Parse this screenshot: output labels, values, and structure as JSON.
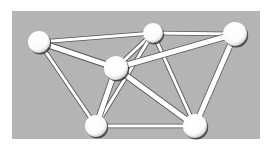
{
  "diagram": {
    "type": "network-graph",
    "colors": {
      "background": "#ffffff",
      "panel": "#b4b4b4",
      "node_fill": "#ffffff",
      "node_shadow": "#2a2a2a",
      "edge_fill": "#ffffff",
      "edge_outline": "#555555"
    },
    "nodes": [
      {
        "id": "A",
        "name": "node-top-left"
      },
      {
        "id": "B",
        "name": "node-top-middle"
      },
      {
        "id": "C",
        "name": "node-center"
      },
      {
        "id": "D",
        "name": "node-bottom-left"
      },
      {
        "id": "E",
        "name": "node-top-right"
      },
      {
        "id": "F",
        "name": "node-bottom-right"
      }
    ],
    "edges": [
      {
        "from": "A",
        "to": "B",
        "style": "thin"
      },
      {
        "from": "A",
        "to": "C",
        "style": "thick"
      },
      {
        "from": "A",
        "to": "D",
        "style": "thin"
      },
      {
        "from": "B",
        "to": "E",
        "style": "thin"
      },
      {
        "from": "B",
        "to": "C",
        "style": "thin"
      },
      {
        "from": "B",
        "to": "D",
        "style": "thin"
      },
      {
        "from": "B",
        "to": "F",
        "style": "thin"
      },
      {
        "from": "C",
        "to": "E",
        "style": "thick"
      },
      {
        "from": "C",
        "to": "D",
        "style": "thick"
      },
      {
        "from": "C",
        "to": "F",
        "style": "thick"
      },
      {
        "from": "E",
        "to": "F",
        "style": "thick"
      },
      {
        "from": "D",
        "to": "F",
        "style": "thin"
      }
    ]
  }
}
